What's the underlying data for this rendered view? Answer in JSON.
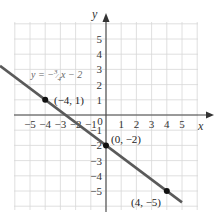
{
  "chart_data": {
    "type": "line",
    "title": "",
    "xlabel": "x",
    "ylabel": "y",
    "xlim": [
      -6,
      6
    ],
    "ylim": [
      -6,
      6
    ],
    "grid": true,
    "x_ticks": [
      -5,
      -4,
      -3,
      -2,
      -1,
      0,
      1,
      2,
      3,
      4,
      5
    ],
    "y_ticks": [
      5,
      4,
      3,
      2,
      1,
      -1,
      -2,
      -3,
      -4,
      -5
    ],
    "x_tick_labels": [
      "−5",
      "−4",
      "−3",
      "−2",
      "−1",
      "0",
      "1",
      "2",
      "3",
      "4",
      "5"
    ],
    "y_tick_labels": [
      "5",
      "4",
      "3",
      "2",
      "1",
      "−1",
      "−2",
      "−3",
      "−4",
      "−5"
    ],
    "series": [
      {
        "name": "y = -3/4 x - 2",
        "equation": "y = −¾x − 2",
        "slope": -0.75,
        "intercept": -2,
        "x": [
          -6,
          5
        ],
        "y": [
          2.5,
          -5.75
        ]
      }
    ],
    "points": [
      {
        "x": -4,
        "y": 1,
        "label": "(−4, 1)"
      },
      {
        "x": 0,
        "y": -2,
        "label": "(0, −2)"
      },
      {
        "x": 4,
        "y": -5,
        "label": "(4, −5)"
      }
    ],
    "annotations": [
      {
        "text": "y = −¾x − 2",
        "near": [
          -4,
          2
        ]
      }
    ],
    "colors": {
      "line": "#5a5a5a",
      "grid": "#d8d8d8",
      "axis": "#444444",
      "point": "#111111"
    }
  },
  "labels": {
    "x_axis": "x",
    "y_axis": "y",
    "equation_prefix": "y = −",
    "equation_num": "3",
    "equation_den": "4",
    "equation_suffix": "x − 2",
    "p1": "(−4, 1)",
    "p2": "(0, −2)",
    "p3": "(4, −5)"
  }
}
